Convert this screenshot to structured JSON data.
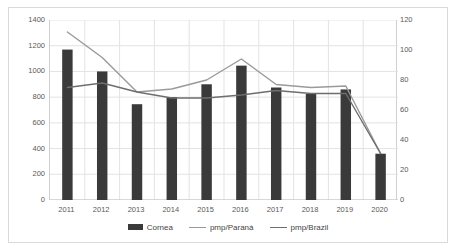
{
  "chart_data": {
    "type": "bar",
    "title": "",
    "xlabel": "",
    "ylabel": "",
    "grid": true,
    "legend_position": "bottom",
    "categories": [
      "2011",
      "2012",
      "2013",
      "2014",
      "2015",
      "2016",
      "2017",
      "2018",
      "2019",
      "2020"
    ],
    "axes": {
      "left": {
        "ylim": [
          0,
          1400
        ],
        "ticks": [
          0,
          200,
          400,
          600,
          800,
          1000,
          1200,
          1400
        ],
        "tick_labels": [
          "0",
          "200",
          "400",
          "600",
          "800",
          "1000",
          "1200",
          "1400"
        ]
      },
      "right": {
        "ylim": [
          0,
          120
        ],
        "ticks": [
          0,
          20,
          40,
          60,
          80,
          100,
          120
        ],
        "tick_labels": [
          "0",
          "20",
          "40",
          "60",
          "80",
          "100",
          "120"
        ]
      }
    },
    "series": [
      {
        "name": "Cornea",
        "kind": "bar",
        "axis": "left",
        "color": "#3a3a3a",
        "values": [
          1170,
          1000,
          745,
          800,
          900,
          1045,
          875,
          825,
          860,
          360
        ]
      },
      {
        "name": "pmp/Paraná",
        "kind": "line",
        "axis": "right",
        "color": "#9a9a9a",
        "values": [
          112,
          95,
          72,
          74,
          80,
          94,
          77,
          75,
          76,
          31
        ]
      },
      {
        "name": "pmp/Brazil",
        "kind": "line",
        "axis": "right",
        "color": "#6e6e6e",
        "values": [
          75,
          78,
          72,
          68,
          68,
          70,
          73,
          71,
          71,
          31
        ]
      }
    ]
  },
  "legend": {
    "items": [
      {
        "label": "Cornea",
        "marker": "bar-swatch"
      },
      {
        "label": "pmp/Paraná",
        "marker": "line-swatch"
      },
      {
        "label": "pmp/Brazil",
        "marker": "line-swatch"
      }
    ]
  }
}
